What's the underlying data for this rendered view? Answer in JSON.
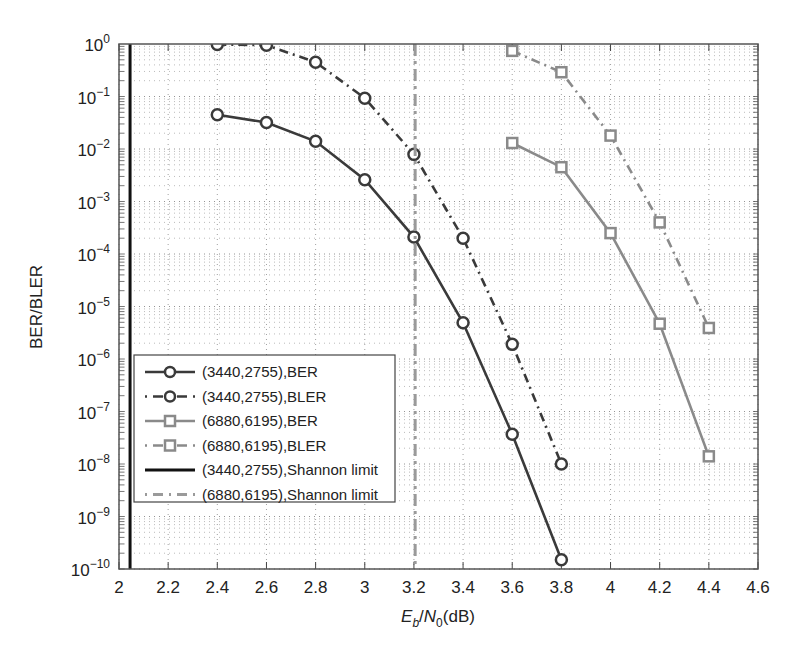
{
  "chart_data": {
    "type": "line",
    "title": "",
    "xlabel": "E_b/N_0(dB)",
    "xlabel_parts": {
      "E": "E",
      "b": "b",
      "slash": "/",
      "N": "N",
      "zero": "0",
      "unit": "(dB)"
    },
    "ylabel": "BER/BLER",
    "xlim": [
      2,
      4.6
    ],
    "ylim": [
      1e-10,
      1
    ],
    "yscale": "log",
    "grid": true,
    "legend_position": "lower left",
    "x_ticks": [
      2,
      2.2,
      2.4,
      2.6,
      2.8,
      3,
      3.2,
      3.4,
      3.6,
      3.8,
      4,
      4.2,
      4.4,
      4.6
    ],
    "x_tick_labels": [
      "2",
      "2.2",
      "2.4",
      "2.6",
      "2.8",
      "3",
      "3.2",
      "3.4",
      "3.6",
      "3.8",
      "4",
      "4.2",
      "4.4",
      "4.6"
    ],
    "y_tick_exponents": [
      0,
      -1,
      -2,
      -3,
      -4,
      -5,
      -6,
      -7,
      -8,
      -9,
      -10
    ],
    "y_tick_labels": [
      "10^0",
      "10^-1",
      "10^-2",
      "10^-3",
      "10^-4",
      "10^-5",
      "10^-6",
      "10^-7",
      "10^-8",
      "10^-9",
      "10^-10"
    ],
    "series": [
      {
        "name": "(3440,2755),BER",
        "color": "#3a3a3a",
        "marker": "circle",
        "line": "solid",
        "x": [
          2.4,
          2.6,
          2.8,
          3.0,
          3.2,
          3.4,
          3.6,
          3.8
        ],
        "values": [
          0.045,
          0.032,
          0.014,
          0.0026,
          0.00021,
          4.9e-06,
          3.7e-08,
          1.5e-10
        ]
      },
      {
        "name": "(3440,2755),BLER",
        "color": "#3a3a3a",
        "marker": "circle",
        "line": "dashdot",
        "x": [
          2.4,
          2.6,
          2.8,
          3.0,
          3.2,
          3.4,
          3.6,
          3.8
        ],
        "values": [
          0.98,
          0.95,
          0.45,
          0.093,
          0.0079,
          0.0002,
          1.9e-06,
          1e-08
        ]
      },
      {
        "name": "(6880,6195),BER",
        "color": "#8a8a8a",
        "marker": "square",
        "line": "solid",
        "x": [
          3.6,
          3.8,
          4.0,
          4.2,
          4.4
        ],
        "values": [
          0.013,
          0.0045,
          0.00025,
          4.7e-06,
          1.4e-08
        ]
      },
      {
        "name": "(6880,6195),BLER",
        "color": "#8a8a8a",
        "marker": "square",
        "line": "dashdot",
        "x": [
          3.6,
          3.8,
          4.0,
          4.2,
          4.4
        ],
        "values": [
          0.74,
          0.29,
          0.018,
          0.0004,
          3.9e-06
        ]
      },
      {
        "name": "(3440,2755),Shannon limit",
        "color": "#111111",
        "marker": "none",
        "line": "solid-thick",
        "vertical_x": 2.045
      },
      {
        "name": "(6880,6195),Shannon limit",
        "color": "#9a9a9a",
        "marker": "none",
        "line": "dashdot-thick",
        "vertical_x": 3.205
      }
    ]
  }
}
